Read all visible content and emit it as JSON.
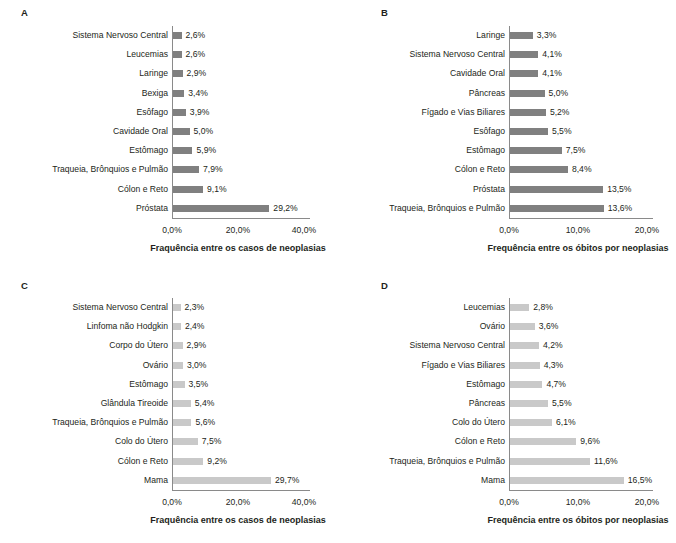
{
  "figure": {
    "width": 676,
    "height": 543,
    "background": "#ffffff",
    "panel_count": 4
  },
  "chart_data": [
    {
      "panel": "A",
      "type": "bar",
      "orientation": "horizontal",
      "title": "",
      "xlabel": "Fraquência entre os casos de neoplasias",
      "ylabel": "",
      "xlim": [
        0,
        44
      ],
      "xticks": [
        0,
        20,
        40
      ],
      "xtick_labels": [
        "0,0%",
        "20,0%",
        "40,0%"
      ],
      "grid": false,
      "legend": "none",
      "bar_color": "#808080",
      "categories": [
        "Sistema Nervoso Central",
        "Leucemias",
        "Laringe",
        "Bexiga",
        "Esôfago",
        "Cavidade Oral",
        "Estômago",
        "Traqueia, Brônquios e Pulmão",
        "Cólon e Reto",
        "Próstata"
      ],
      "values": [
        2.6,
        2.6,
        2.9,
        3.4,
        3.9,
        5.0,
        5.9,
        7.9,
        9.1,
        29.2
      ],
      "data_labels": [
        "2,6%",
        "2,6%",
        "2,9%",
        "3,4%",
        "3,9%",
        "5,0%",
        "5,9%",
        "7,9%",
        "9,1%",
        "29,2%"
      ]
    },
    {
      "panel": "B",
      "type": "bar",
      "orientation": "horizontal",
      "title": "",
      "xlabel": "Frequência entre os óbitos por neoplasias",
      "ylabel": "",
      "xlim": [
        0,
        22
      ],
      "xticks": [
        0,
        10,
        20
      ],
      "xtick_labels": [
        "0,0%",
        "10,0%",
        "20,0%"
      ],
      "grid": false,
      "legend": "none",
      "bar_color": "#808080",
      "categories": [
        "Laringe",
        "Sistema Nervoso Central",
        "Cavidade Oral",
        "Pâncreas",
        "Fígado e Vias Biliares",
        "Esôfago",
        "Estômago",
        "Cólon e Reto",
        "Próstata",
        "Traqueia, Brônquios e Pulmão"
      ],
      "values": [
        3.3,
        4.1,
        4.1,
        5.0,
        5.2,
        5.5,
        7.5,
        8.4,
        13.5,
        13.6
      ],
      "data_labels": [
        "3,3%",
        "4,1%",
        "4,1%",
        "5,0%",
        "5,2%",
        "5,5%",
        "7,5%",
        "8,4%",
        "13,5%",
        "13,6%"
      ]
    },
    {
      "panel": "C",
      "type": "bar",
      "orientation": "horizontal",
      "title": "",
      "xlabel": "Fraquência entre os casos de neoplasias",
      "ylabel": "",
      "xlim": [
        0,
        44
      ],
      "xticks": [
        0,
        20,
        40
      ],
      "xtick_labels": [
        "0,0%",
        "20,0%",
        "40,0%"
      ],
      "grid": false,
      "legend": "none",
      "bar_color": "#c9c9c9",
      "categories": [
        "Sistema Nervoso Central",
        "Linfoma não Hodgkin",
        "Corpo do Útero",
        "Ovário",
        "Estômago",
        "Glândula Tireoide",
        "Traqueia, Brônquios e Pulmão",
        "Colo do Útero",
        "Cólon e Reto",
        "Mama"
      ],
      "values": [
        2.3,
        2.4,
        2.9,
        3.0,
        3.5,
        5.4,
        5.6,
        7.5,
        9.2,
        29.7
      ],
      "data_labels": [
        "2,3%",
        "2,4%",
        "2,9%",
        "3,0%",
        "3,5%",
        "5,4%",
        "5,6%",
        "7,5%",
        "9,2%",
        "29,7%"
      ]
    },
    {
      "panel": "D",
      "type": "bar",
      "orientation": "horizontal",
      "title": "",
      "xlabel": "Frequência entre os óbitos por neoplasias",
      "ylabel": "",
      "xlim": [
        0,
        22
      ],
      "xticks": [
        0,
        10,
        20
      ],
      "xtick_labels": [
        "0,0%",
        "10,0%",
        "20,0%"
      ],
      "grid": false,
      "legend": "none",
      "bar_color": "#c9c9c9",
      "categories": [
        "Leucemias",
        "Ovário",
        "Sistema Nervoso Central",
        "Fígado e Vias Biliares",
        "Estômago",
        "Pâncreas",
        "Colo do Útero",
        "Cólon e Reto",
        "Traqueia, Brônquios e Pulmão",
        "Mama"
      ],
      "values": [
        2.8,
        3.6,
        4.2,
        4.3,
        4.7,
        5.5,
        6.1,
        9.6,
        11.6,
        16.5
      ],
      "data_labels": [
        "2,8%",
        "3,6%",
        "4,2%",
        "4,3%",
        "4,7%",
        "5,5%",
        "6,1%",
        "9,6%",
        "11,6%",
        "16,5%"
      ]
    }
  ],
  "panels": {
    "A": {
      "letter": "A"
    },
    "B": {
      "letter": "B"
    },
    "C": {
      "letter": "C"
    },
    "D": {
      "letter": "D"
    }
  }
}
